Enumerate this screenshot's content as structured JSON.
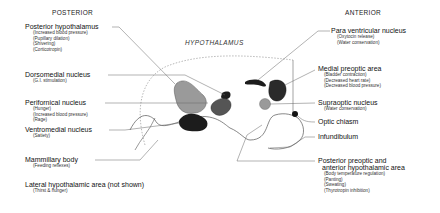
{
  "headers": {
    "posterior": "POSTERIOR",
    "anterior": "ANTERIOR",
    "center_title": "HYPOTHALAMUS"
  },
  "posterior_labels": [
    {
      "name": "Posterior hypothalamus",
      "functions": [
        "(Increased blood pressure)",
        "(Pupillary dilation)",
        "(Shivering)",
        "(Corticotropin)"
      ]
    },
    {
      "name": "Dorsomedial nucleus",
      "functions": [
        "(G.I. stimulation)"
      ]
    },
    {
      "name": "Perifornical nucleus",
      "functions": [
        "(Hunger)",
        "(Increased blood pressure)",
        "(Rage)"
      ]
    },
    {
      "name": "Ventromedial nucleus",
      "functions": [
        "(Satiety)"
      ]
    },
    {
      "name": "Mammillary body",
      "functions": [
        "(Feeding reflexes)"
      ]
    },
    {
      "name": "Lateral hypothalamic area (not shown)",
      "functions": [
        "(Thirst & hunger)"
      ]
    }
  ],
  "anterior_labels": [
    {
      "name": "Para ventricular nucleus",
      "functions": [
        "(Oxytocin release)",
        "(Water conservation)"
      ]
    },
    {
      "name": "Medial preoptic area",
      "functions": [
        "(Bladder contraction)",
        "(Decreased heart rate)",
        "(Decreased blood pressure)"
      ]
    },
    {
      "name": "Supraoptic nucleus",
      "functions": [
        "(Water conservation)"
      ]
    },
    {
      "name": "Optic chiasm",
      "functions": []
    },
    {
      "name": "Infundibulum",
      "functions": []
    },
    {
      "name": "Posterior preoptic and",
      "name2": "anterior hypothalamic area",
      "functions": [
        "(Body temperature regulation)",
        "(Panting)",
        "(Sweating)",
        "(Thyrotropin inhibition)"
      ]
    }
  ],
  "colors": {
    "line": "#666666",
    "dark_nucleus": "#1c1c1c",
    "gray_nucleus": "#9a9a9a",
    "mid_nucleus": "#555555"
  }
}
